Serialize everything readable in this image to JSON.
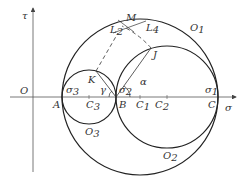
{
  "axes": {
    "x_label": "σ",
    "y_label": "τ",
    "origin_label": "O"
  },
  "points": {
    "A": "A",
    "B": "B",
    "C": "C",
    "C1": "C",
    "C2": "C",
    "C3": "C",
    "K": "K",
    "J": "J",
    "M": "M"
  },
  "subscripts": {
    "one": "1",
    "two": "2",
    "three": "3"
  },
  "stress_labels": {
    "sigma": "σ"
  },
  "circle_labels": {
    "O": "O"
  },
  "lines": {
    "L": "L"
  },
  "angles": {
    "alpha": "α",
    "gamma": "γ"
  },
  "colors": {
    "stroke": "#222222",
    "axis": "#444444",
    "text": "#333333",
    "background": "#ffffff"
  }
}
